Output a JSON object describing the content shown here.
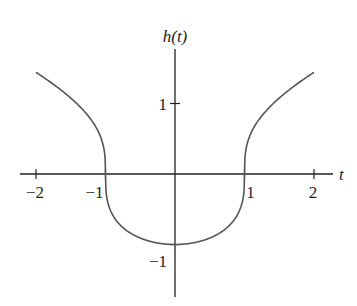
{
  "chart_data": {
    "type": "line",
    "title": "",
    "xlabel": "t",
    "ylabel": "h(t)",
    "xlim": [
      -2.2,
      2.25
    ],
    "ylim": [
      -1.8,
      1.8
    ],
    "grid": false,
    "legend": null,
    "x_ticks": [
      -2,
      -1,
      1,
      2
    ],
    "x_tick_labels": [
      "−2",
      "−1",
      "1",
      "2"
    ],
    "y_ticks": [
      1,
      -1
    ],
    "y_tick_labels": [
      "1",
      "−1"
    ],
    "series": [
      {
        "name": "h(t)",
        "color": "#555555",
        "x": [
          -2,
          -1.75,
          -1.5,
          -1.25,
          -1.1,
          -1.02,
          -1,
          -0.98,
          -0.9,
          -0.75,
          -0.5,
          -0.25,
          0,
          0.25,
          0.5,
          0.75,
          0.9,
          0.98,
          1,
          1.02,
          1.1,
          1.25,
          1.5,
          1.75,
          2
        ],
        "values": [
          1.44,
          1.28,
          1.08,
          0.83,
          0.59,
          0.34,
          0,
          -0.34,
          -0.57,
          -0.76,
          -0.91,
          -0.98,
          -1,
          -0.98,
          -0.91,
          -0.76,
          -0.57,
          -0.34,
          0,
          0.34,
          0.59,
          0.83,
          1.08,
          1.28,
          1.44
        ]
      }
    ]
  }
}
